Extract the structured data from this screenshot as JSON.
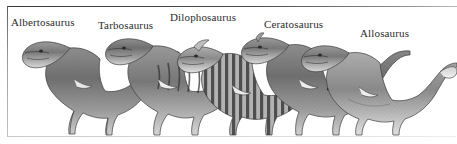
{
  "plate": {
    "medium": "engraving",
    "palette": "grayscale",
    "background_color": "#ffffff",
    "ink_color": "#2b2b2b",
    "frame": {
      "top_rule_color": "#3a3a3a",
      "left_rule_color": "#5c5c5c",
      "bottom_rule_color": "#c9c9c9"
    }
  },
  "labels": [
    {
      "name": "Albertosaurus",
      "x": 11,
      "y": 17
    },
    {
      "name": "Tarbosaurus",
      "x": 98,
      "y": 20
    },
    {
      "name": "Dilophosaurus",
      "x": 170,
      "y": 12
    },
    {
      "name": "Ceratosaurus",
      "x": 264,
      "y": 19
    },
    {
      "name": "Allosaurus",
      "x": 360,
      "y": 28
    }
  ],
  "figures": [
    {
      "subject": "Albertosaurus",
      "facing": "left",
      "pose": "standing-bipedal",
      "order": 1
    },
    {
      "subject": "Tarbosaurus",
      "facing": "left",
      "pose": "standing-bipedal",
      "order": 2
    },
    {
      "subject": "Dilophosaurus",
      "facing": "left",
      "pose": "standing-bipedal",
      "markings": "striped",
      "order": 3
    },
    {
      "subject": "Ceratosaurus",
      "facing": "left",
      "pose": "standing-bipedal",
      "order": 4
    },
    {
      "subject": "Allosaurus",
      "facing": "left",
      "pose": "standing-bipedal",
      "order": 5
    }
  ]
}
